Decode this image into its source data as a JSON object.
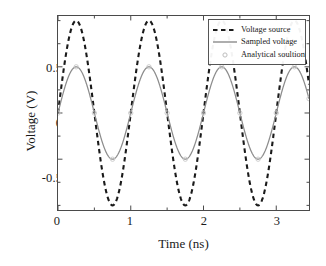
{
  "chart_data": {
    "type": "line",
    "title": "",
    "xlabel": "Time (ns)",
    "ylabel": "Voltage (V)",
    "xlim": [
      0,
      3.45
    ],
    "ylim": [
      -1.05,
      1.05
    ],
    "xticks": [
      0,
      1,
      2,
      3
    ],
    "yticks": [
      -0.5,
      0,
      0.5
    ],
    "xtick_labels": [
      "0",
      "1",
      "2",
      "3"
    ],
    "ytick_labels": [
      "-0.5",
      "0",
      "0.5"
    ],
    "grid": false,
    "legend_position": "upper right",
    "series": [
      {
        "name": "Voltage source",
        "style": "dashed",
        "color": "#1a1a1a",
        "amplitude": 1.0,
        "period_ns": 1.0,
        "phase": 0.0,
        "x": [
          0,
          0.05,
          0.1,
          0.15,
          0.2,
          0.25,
          0.3,
          0.35,
          0.4,
          0.45,
          0.5,
          0.55,
          0.6,
          0.65,
          0.7,
          0.75,
          0.8,
          0.85,
          0.9,
          0.95,
          1.0,
          1.05,
          1.1,
          1.15,
          1.2,
          1.25,
          1.3,
          1.35,
          1.4,
          1.45,
          1.5,
          1.55,
          1.6,
          1.65,
          1.7,
          1.75,
          1.8,
          1.85,
          1.9,
          1.95,
          2.0,
          2.05,
          2.1,
          2.15,
          2.2,
          2.25,
          2.3,
          2.35,
          2.4,
          2.45,
          2.5,
          2.55,
          2.6,
          2.65,
          2.7,
          2.75,
          2.8,
          2.85,
          2.9,
          2.95,
          3.0,
          3.05,
          3.1,
          3.15,
          3.2,
          3.25,
          3.3,
          3.35,
          3.4,
          3.45
        ],
        "y": [
          0.0,
          0.309,
          0.588,
          0.809,
          0.951,
          1.0,
          0.951,
          0.809,
          0.588,
          0.309,
          0.0,
          -0.309,
          -0.588,
          -0.809,
          -0.951,
          -1.0,
          -0.951,
          -0.809,
          -0.588,
          -0.309,
          0.0,
          0.309,
          0.588,
          0.809,
          0.951,
          1.0,
          0.951,
          0.809,
          0.588,
          0.309,
          0.0,
          -0.309,
          -0.588,
          -0.809,
          -0.951,
          -1.0,
          -0.951,
          -0.809,
          -0.588,
          -0.309,
          0.0,
          0.309,
          0.588,
          0.809,
          0.951,
          1.0,
          0.951,
          0.809,
          0.588,
          0.309,
          0.0,
          -0.309,
          -0.588,
          -0.809,
          -0.951,
          -1.0,
          -0.951,
          -0.809,
          -0.588,
          -0.309,
          0.0,
          0.309,
          0.588,
          0.809,
          0.951,
          1.0,
          0.951,
          0.809,
          0.588,
          0.309
        ]
      },
      {
        "name": "Sampled voltage",
        "style": "solid",
        "color": "#8c8c8c",
        "amplitude": 0.5,
        "period_ns": 1.0,
        "phase": 0.0,
        "x": [
          0,
          0.05,
          0.1,
          0.15,
          0.2,
          0.25,
          0.3,
          0.35,
          0.4,
          0.45,
          0.5,
          0.55,
          0.6,
          0.65,
          0.7,
          0.75,
          0.8,
          0.85,
          0.9,
          0.95,
          1.0,
          1.05,
          1.1,
          1.15,
          1.2,
          1.25,
          1.3,
          1.35,
          1.4,
          1.45,
          1.5,
          1.55,
          1.6,
          1.65,
          1.7,
          1.75,
          1.8,
          1.85,
          1.9,
          1.95,
          2.0,
          2.05,
          2.1,
          2.15,
          2.2,
          2.25,
          2.3,
          2.35,
          2.4,
          2.45,
          2.5,
          2.55,
          2.6,
          2.65,
          2.7,
          2.75,
          2.8,
          2.85,
          2.9,
          2.95,
          3.0,
          3.05,
          3.1,
          3.15,
          3.2,
          3.25,
          3.3,
          3.35,
          3.4,
          3.45
        ],
        "y": [
          0.0,
          0.155,
          0.294,
          0.405,
          0.476,
          0.5,
          0.476,
          0.405,
          0.294,
          0.155,
          0.0,
          -0.155,
          -0.294,
          -0.405,
          -0.476,
          -0.5,
          -0.476,
          -0.405,
          -0.294,
          -0.155,
          0.0,
          0.155,
          0.294,
          0.405,
          0.476,
          0.5,
          0.476,
          0.405,
          0.294,
          0.155,
          0.0,
          -0.155,
          -0.294,
          -0.405,
          -0.476,
          -0.5,
          -0.476,
          -0.405,
          -0.294,
          -0.155,
          0.0,
          0.155,
          0.294,
          0.405,
          0.476,
          0.5,
          0.476,
          0.405,
          0.294,
          0.155,
          0.0,
          -0.155,
          -0.294,
          -0.405,
          -0.476,
          -0.5,
          -0.476,
          -0.405,
          -0.294,
          -0.155,
          0.0,
          0.155,
          0.294,
          0.405,
          0.476,
          0.5,
          0.476,
          0.405,
          0.294,
          0.155
        ]
      },
      {
        "name": "Analytical soultion",
        "style": "markers",
        "marker": "circle",
        "color": "#c8c8c8",
        "amplitude": 0.5,
        "period_ns": 1.0,
        "phase": 0.0,
        "x": [
          0.0,
          0.25,
          0.5,
          0.75,
          1.0,
          1.25,
          1.5,
          1.75,
          2.0,
          2.25,
          2.5,
          2.75,
          3.0,
          3.25,
          3.45
        ],
        "y": [
          0.0,
          0.5,
          0.0,
          -0.5,
          0.0,
          0.5,
          0.0,
          -0.5,
          0.0,
          0.5,
          0.0,
          -0.5,
          0.0,
          0.5,
          0.155
        ]
      }
    ]
  },
  "legend": {
    "items": [
      {
        "label": "Voltage source"
      },
      {
        "label": "Sampled voltage"
      },
      {
        "label": "Analytical soultion"
      }
    ]
  },
  "colors": {
    "axis": "#4a4a4a",
    "source_line": "#1a1a1a",
    "sampled_line": "#8c8c8c",
    "marker": "#c8c8c8",
    "background": "#ffffff"
  }
}
